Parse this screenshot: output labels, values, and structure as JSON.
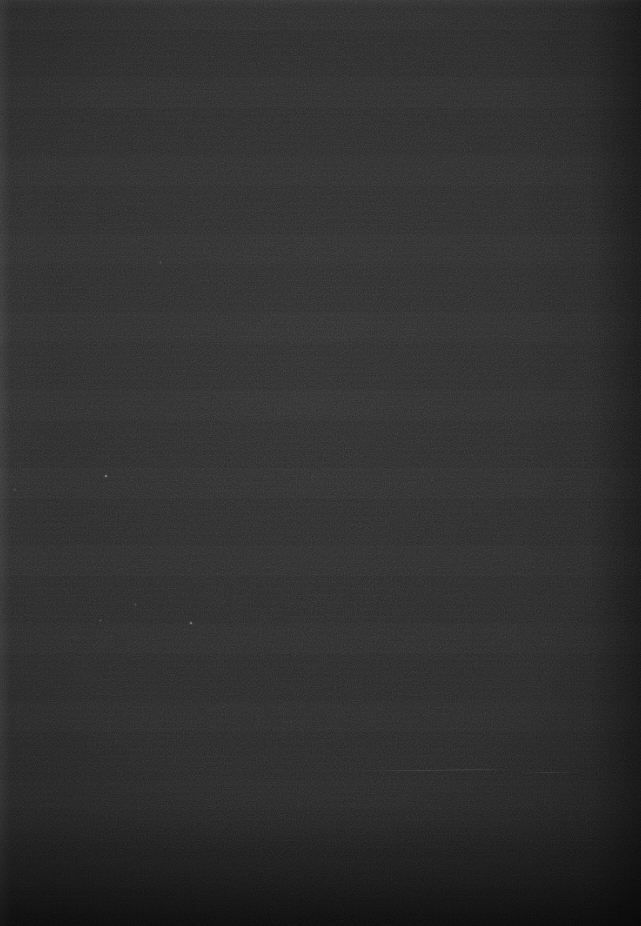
{
  "image": {
    "kind": "dark-frame",
    "description": "Underexposed, essentially featureless dark frame with faint horizontal banding and fine grain. No text, icons, controls or chart content is present.",
    "width": 641,
    "height": 926,
    "caption": ""
  },
  "tones": {
    "base": "#282828",
    "top_edge": "#2d2d2d",
    "upper_field": "#2b2b2b",
    "mid_field": "#2a2a2a",
    "lower_field": "#282828",
    "bottom_band": "#1b1b1b",
    "left_strip": "#303030",
    "right_margin": "#202020"
  },
  "regions": [
    {
      "name": "top-edge-highlight",
      "x": 0,
      "y": 0,
      "width": 641,
      "height": 9,
      "tone": "#2d2d2d"
    },
    {
      "name": "upper-field",
      "x": 0,
      "y": 9,
      "width": 641,
      "height": 291,
      "tone": "#2b2b2b"
    },
    {
      "name": "mid-field",
      "x": 0,
      "y": 300,
      "width": 641,
      "height": 460,
      "tone": "#2a2a2a"
    },
    {
      "name": "lower-field",
      "x": 0,
      "y": 760,
      "width": 641,
      "height": 60,
      "tone": "#242424"
    },
    {
      "name": "bottom-band",
      "x": 0,
      "y": 820,
      "width": 641,
      "height": 106,
      "tone": "#1b1b1b"
    },
    {
      "name": "left-strip",
      "x": 0,
      "y": 0,
      "width": 11,
      "height": 926,
      "tone": "#303030"
    },
    {
      "name": "right-margin",
      "x": 589,
      "y": 0,
      "width": 52,
      "height": 926,
      "tone": "#202020"
    }
  ],
  "specks": [
    {
      "name": "speck-a",
      "x": 105,
      "y": 475,
      "size": 2,
      "tone": "#8d8d8d"
    },
    {
      "name": "speck-b",
      "x": 100,
      "y": 620,
      "size": 1,
      "tone": "#7a7a7a"
    },
    {
      "name": "speck-c",
      "x": 190,
      "y": 622,
      "size": 2,
      "tone": "#8a8a8a"
    },
    {
      "name": "speck-d",
      "x": 160,
      "y": 262,
      "size": 1,
      "tone": "#6e6e6e"
    },
    {
      "name": "speck-e",
      "x": 14,
      "y": 489,
      "size": 1,
      "tone": "#6a6a6a"
    },
    {
      "name": "speck-f",
      "x": 135,
      "y": 604,
      "size": 1,
      "tone": "#707070"
    }
  ],
  "streaks": [
    {
      "name": "streak-a",
      "x": 360,
      "y": 770,
      "width": 120
    },
    {
      "name": "streak-b",
      "x": 440,
      "y": 769,
      "width": 70
    },
    {
      "name": "streak-c",
      "x": 520,
      "y": 772,
      "width": 60
    }
  ],
  "texture": {
    "banding": "horizontal",
    "grain": "fine",
    "vignette": true
  }
}
